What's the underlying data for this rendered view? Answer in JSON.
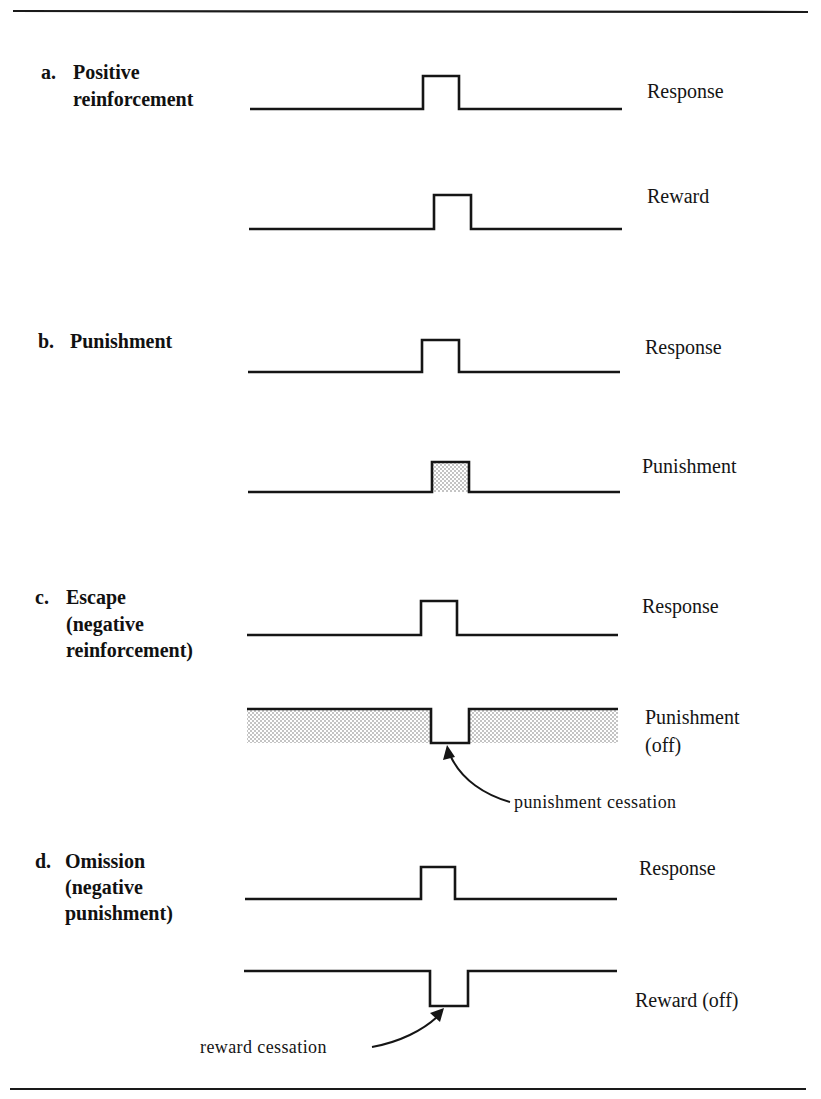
{
  "figure": {
    "sections": [
      {
        "id": "a",
        "letter": "a.",
        "title_lines": [
          "Positive",
          "reinforcement"
        ],
        "traces": [
          {
            "label_lines": [
              "Response"
            ],
            "kind": "pulse-up",
            "shaded": false
          },
          {
            "label_lines": [
              "Reward"
            ],
            "kind": "pulse-up",
            "shaded": false
          }
        ]
      },
      {
        "id": "b",
        "letter": "b.",
        "title_lines": [
          "Punishment"
        ],
        "traces": [
          {
            "label_lines": [
              "Response"
            ],
            "kind": "pulse-up",
            "shaded": false
          },
          {
            "label_lines": [
              "Punishment"
            ],
            "kind": "pulse-up",
            "shaded": true
          }
        ]
      },
      {
        "id": "c",
        "letter": "c.",
        "title_lines": [
          "Escape",
          "(negative",
          "reinforcement)"
        ],
        "traces": [
          {
            "label_lines": [
              "Response"
            ],
            "kind": "pulse-up",
            "shaded": false
          },
          {
            "label_lines": [
              "Punishment",
              "(off)"
            ],
            "kind": "notch-down",
            "shaded": true
          }
        ],
        "annotation": "punishment cessation"
      },
      {
        "id": "d",
        "letter": "d.",
        "title_lines": [
          "Omission",
          "(negative",
          "punishment)"
        ],
        "traces": [
          {
            "label_lines": [
              "Response"
            ],
            "kind": "pulse-up",
            "shaded": false
          },
          {
            "label_lines": [
              "Reward (off)"
            ],
            "kind": "notch-down",
            "shaded": false
          }
        ],
        "annotation": "reward cessation"
      }
    ]
  },
  "colors": {
    "ink": "#151515",
    "background": "#ffffff",
    "stipple": "#8a8a8a"
  }
}
